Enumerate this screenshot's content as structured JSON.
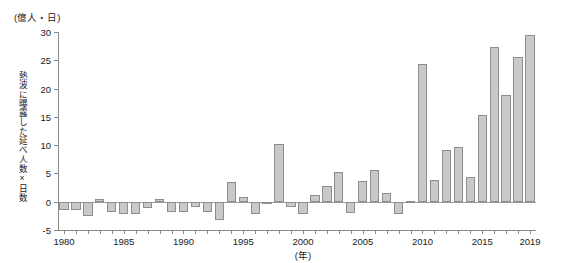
{
  "figure": {
    "unit_caption": "(億人・日)",
    "y_axis_title": "熱波に曝露した延べ人数×日数",
    "x_axis_unit": "(年)"
  },
  "chart_data": {
    "type": "bar",
    "title": "",
    "xlabel": "(年)",
    "ylabel": "熱波に曝露した延べ人数×日数",
    "unit": "(億人・日)",
    "grid": false,
    "legend": "none",
    "ylim": [
      -5,
      30
    ],
    "yticks": [
      -5,
      0,
      5,
      10,
      15,
      20,
      25,
      30
    ],
    "ytick_labels": [
      "-5",
      "0",
      "5",
      "10",
      "15",
      "20",
      "25",
      "30"
    ],
    "xlim": [
      1979.5,
      2019.5
    ],
    "xticks": [
      1980,
      1985,
      1990,
      1995,
      2000,
      2005,
      2010,
      2015,
      2019
    ],
    "xtick_labels": [
      "1980",
      "1985",
      "1990",
      "1995",
      "2000",
      "2005",
      "2010",
      "2015",
      "2019"
    ],
    "bar_color": "#c9c9c9",
    "bar_edge_color": "#8d8d8d",
    "categories": [
      "1980",
      "1981",
      "1982",
      "1983",
      "1984",
      "1985",
      "1986",
      "1987",
      "1988",
      "1989",
      "1990",
      "1991",
      "1992",
      "1993",
      "1994",
      "1995",
      "1996",
      "1997",
      "1998",
      "1999",
      "2000",
      "2001",
      "2002",
      "2003",
      "2004",
      "2005",
      "2006",
      "2007",
      "2008",
      "2009",
      "2010",
      "2011",
      "2012",
      "2013",
      "2014",
      "2015",
      "2016",
      "2017",
      "2018",
      "2019"
    ],
    "values": [
      -1.5,
      -1.5,
      -2.5,
      0.5,
      -1.8,
      -2.2,
      -2.2,
      -1.2,
      0.4,
      -1.8,
      -1.8,
      -1.0,
      -1.8,
      -3.2,
      3.4,
      0.8,
      -2.2,
      -0.4,
      10.2,
      -1.0,
      -2.2,
      1.2,
      2.8,
      5.2,
      -2.0,
      3.6,
      5.6,
      1.6,
      -2.2,
      0.2,
      24.4,
      3.8,
      9.2,
      9.6,
      4.4,
      15.4,
      27.4,
      18.8,
      25.6,
      29.4
    ]
  }
}
